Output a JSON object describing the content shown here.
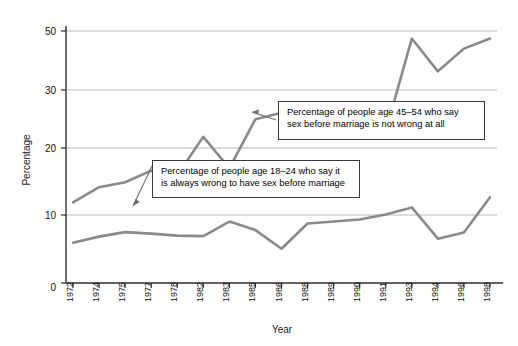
{
  "chart_data": {
    "type": "line",
    "title": "",
    "xlabel": "Year",
    "ylabel": "Percentage",
    "categories": [
      "1972",
      "1974",
      "1975",
      "1977",
      "1978",
      "1982",
      "1983",
      "1985",
      "1986",
      "1988",
      "1989",
      "1990",
      "1991",
      "1993",
      "1994",
      "1996",
      "1998"
    ],
    "ylim": [
      0,
      52
    ],
    "yticks": [
      0,
      10,
      20,
      30,
      50
    ],
    "ytick_labels": [
      "0",
      "10",
      "20",
      "30",
      "50"
    ],
    "grid": "horizontal",
    "legend": "none",
    "series": [
      {
        "name": "Percentage of people age 45–54 who say sex before marriage is not wrong at all",
        "color": "#8a8a8a",
        "values": [
          16.0,
          19.0,
          20.0,
          22.3,
          21.4,
          29.0,
          22.8,
          32.5,
          33.8,
          30.2,
          33.0,
          31.0,
          30.1,
          48.5,
          42.0,
          46.5,
          48.5
        ]
      },
      {
        "name": "Percentage of people age 18–24 who say it is always wrong to have sex before marriage",
        "color": "#8a8a8a",
        "values": [
          8.0,
          9.2,
          10.1,
          9.8,
          9.4,
          9.3,
          12.2,
          10.5,
          6.8,
          11.8,
          12.2,
          12.6,
          13.6,
          15.0,
          8.8,
          10.0,
          17.0
        ]
      }
    ],
    "annotations": [
      {
        "id": "callout-upper",
        "text": "Percentage of people age 45–54 who say\nsex before marriage is not wrong at all",
        "points_to": "upper-line"
      },
      {
        "id": "callout-lower",
        "text": "Percentage of people age 18–24 who say it\nis always wrong to have sex before marriage",
        "points_to": "lower-line"
      }
    ]
  },
  "axes": {
    "y_title": "Percentage",
    "x_title": "Year"
  }
}
